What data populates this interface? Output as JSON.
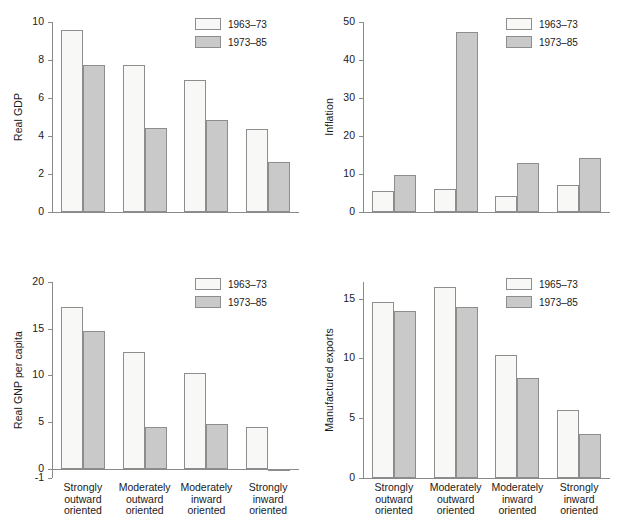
{
  "figure": {
    "categories": [
      "Strongly\noutward\noriented",
      "Moderately\noutward\noriented",
      "Moderately\ninward\noriented",
      "Strongly\ninward\noriented"
    ],
    "colors": {
      "light_fill": "#f8f8f6",
      "shade_fill": "#c9c9c9",
      "stroke": "#8d8d8d",
      "axis": "#8a8a8a"
    }
  },
  "chart_data": [
    {
      "id": "real-gdp",
      "type": "bar",
      "title": "",
      "ylabel": "Real GDP",
      "xlabel": "",
      "categories": [
        "Strongly outward oriented",
        "Moderately outward oriented",
        "Moderately inward oriented",
        "Strongly inward oriented"
      ],
      "ylim": [
        0,
        10
      ],
      "yticks": [
        0,
        2,
        4,
        6,
        8,
        10
      ],
      "ytick_labels": [
        "0",
        "2",
        "4",
        "6",
        "8",
        "10"
      ],
      "grid": false,
      "legend_position": "top-right",
      "series": [
        {
          "name": "1963–73",
          "values": [
            9.6,
            7.75,
            6.95,
            4.35
          ]
        },
        {
          "name": "1973–85",
          "values": [
            7.75,
            4.4,
            4.85,
            2.65
          ]
        }
      ]
    },
    {
      "id": "inflation",
      "type": "bar",
      "title": "",
      "ylabel": "Inflation",
      "xlabel": "",
      "categories": [
        "Strongly outward oriented",
        "Moderately outward oriented",
        "Moderately inward oriented",
        "Strongly inward oriented"
      ],
      "ylim": [
        0,
        50
      ],
      "yticks": [
        0,
        10,
        20,
        30,
        40,
        50
      ],
      "ytick_labels": [
        "0",
        "10",
        "20",
        "30",
        "40",
        "50"
      ],
      "grid": false,
      "legend_position": "top-right",
      "series": [
        {
          "name": "1963–73",
          "values": [
            5.4,
            6.0,
            4.2,
            7.0
          ]
        },
        {
          "name": "1973–85",
          "values": [
            9.8,
            47.3,
            12.8,
            14.1
          ]
        }
      ]
    },
    {
      "id": "real-gnp-per-capita",
      "type": "bar",
      "title": "",
      "ylabel": "Real GNP per capita",
      "xlabel": "",
      "categories": [
        "Strongly outward oriented",
        "Moderately outward oriented",
        "Moderately inward oriented",
        "Strongly inward oriented"
      ],
      "ylim": [
        -1,
        20
      ],
      "yticks": [
        -1,
        0,
        5,
        10,
        15,
        20
      ],
      "ytick_labels": [
        "-1",
        "0",
        "5",
        "10",
        "15",
        "20"
      ],
      "grid": false,
      "legend_position": "top-right",
      "series": [
        {
          "name": "1963–73",
          "values": [
            17.3,
            12.5,
            10.2,
            4.45
          ]
        },
        {
          "name": "1973–85",
          "values": [
            14.8,
            4.45,
            4.75,
            -0.25
          ]
        }
      ]
    },
    {
      "id": "manufactured-exports",
      "type": "bar",
      "title": "",
      "ylabel": "Manufactured exports",
      "xlabel": "",
      "categories": [
        "Strongly outward oriented",
        "Moderately outward oriented",
        "Moderately inward oriented",
        "Strongly inward oriented"
      ],
      "ylim": [
        0,
        16.4
      ],
      "yticks": [
        0,
        5,
        10,
        15
      ],
      "ytick_labels": [
        "0",
        "5",
        "10",
        "15"
      ],
      "grid": false,
      "legend_position": "top-right",
      "series": [
        {
          "name": "1965–73",
          "values": [
            14.7,
            16.0,
            10.3,
            5.7
          ]
        },
        {
          "name": "1973–85",
          "values": [
            14.0,
            14.3,
            8.4,
            3.7
          ]
        }
      ]
    }
  ]
}
